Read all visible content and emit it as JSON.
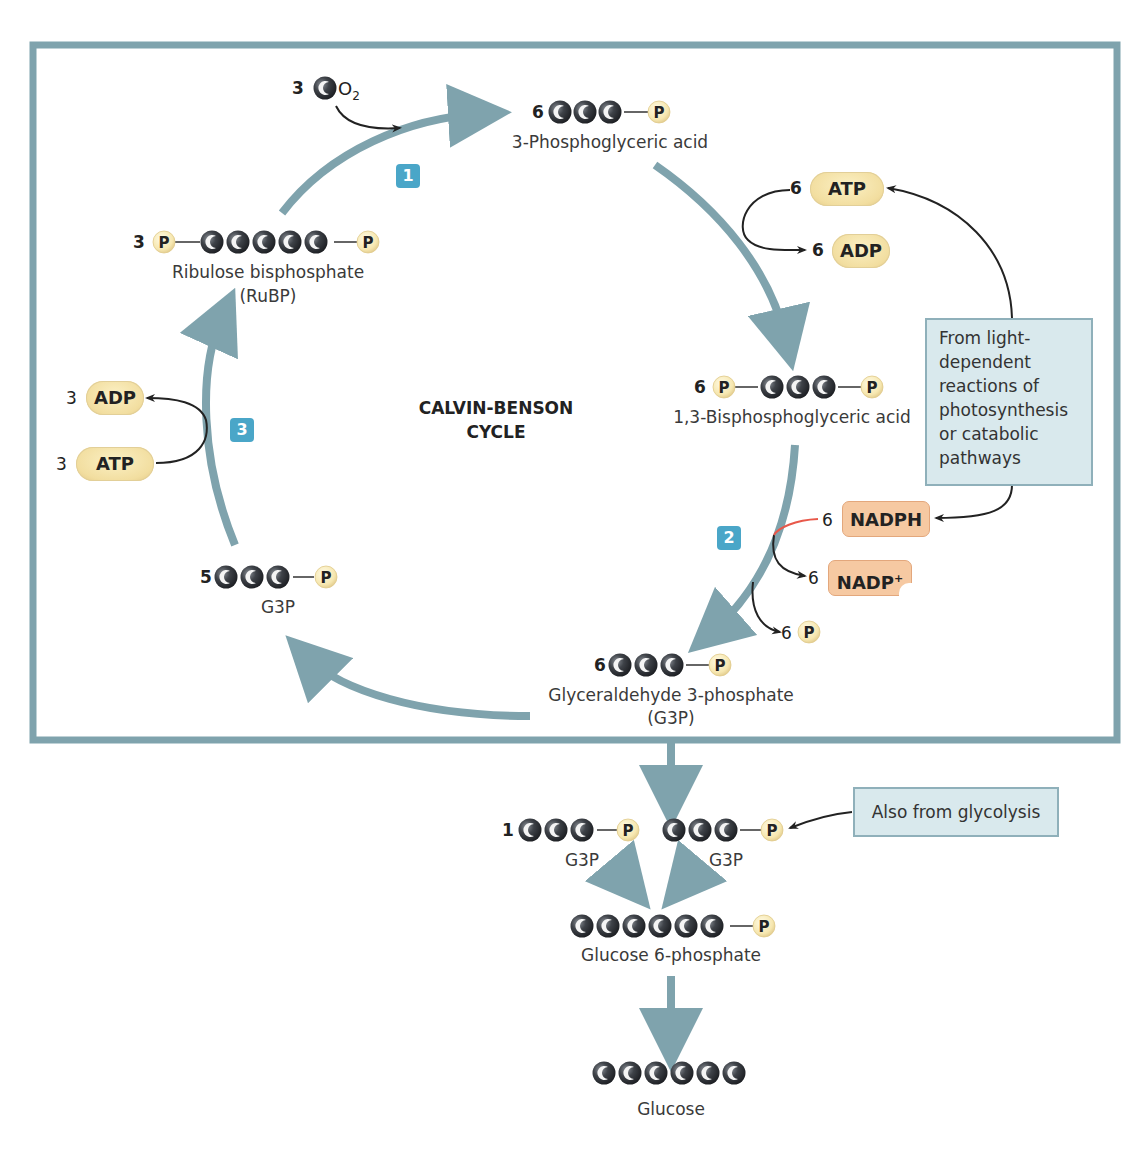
{
  "diagram": {
    "title_line1": "CALVIN-BENSON",
    "title_line2": "CYCLE",
    "colors": {
      "frame": "#7fa3ad",
      "cycle_arrow": "#7fa3ad",
      "step_badge": "#4aa6c8",
      "carbon": "#3a3d42",
      "phosphate": "#f6e7b0",
      "atp_adp": "#f2dea0",
      "nadph": "#f6c9a2",
      "note_box": "#d9e9ed",
      "nadph_line": "#e8584a"
    },
    "steps": [
      {
        "label": "1"
      },
      {
        "label": "2"
      },
      {
        "label": "3"
      }
    ],
    "co2_input": {
      "count": "3",
      "carbon_glyph": "C",
      "formula": "O",
      "subscript": "2"
    },
    "molecules": {
      "pga": {
        "count": "6",
        "name": "3-Phosphoglyceric acid",
        "carbons": 3,
        "phosphates": "1"
      },
      "bpga": {
        "count": "6",
        "name": "1,3-Bisphosphoglyceric acid",
        "carbons": 3,
        "phosphates": "2"
      },
      "g3p_main": {
        "count": "6",
        "name": "Glyceraldehyde 3-phosphate",
        "abbrev": "(G3P)",
        "carbons": 3
      },
      "g3p_recycle": {
        "count": "5",
        "name": "G3P",
        "carbons": 3
      },
      "rubp": {
        "count": "3",
        "name": "Ribulose bisphosphate",
        "abbrev": "(RuBP)",
        "carbons": 5
      },
      "g3p_out": {
        "count": "1",
        "name": "G3P",
        "carbons": 3
      },
      "g3p_glycolysis": {
        "name": "G3P",
        "carbons": 3
      },
      "g6p": {
        "name": "Glucose 6-phosphate",
        "carbons": 6
      },
      "glucose": {
        "name": "Glucose",
        "carbons": 6
      }
    },
    "cofactors": {
      "atp_step1": {
        "count": "6",
        "label": "ATP"
      },
      "adp_step1": {
        "count": "6",
        "label": "ADP"
      },
      "nadph": {
        "count": "6",
        "label": "NADPH"
      },
      "nadp": {
        "count": "6",
        "label": "NADP",
        "sup": "+"
      },
      "pi_release": {
        "count": "6",
        "label": "P"
      },
      "adp_step3": {
        "count": "3",
        "label": "ADP"
      },
      "atp_step3": {
        "count": "3",
        "label": "ATP"
      }
    },
    "notes": {
      "light_reactions": [
        "From light-",
        "dependent",
        "reactions of",
        "photosynthesis",
        "or catabolic",
        "pathways"
      ],
      "glycolysis": "Also from glycolysis"
    },
    "glyph": {
      "carbon": "C",
      "phosphate": "P"
    }
  }
}
